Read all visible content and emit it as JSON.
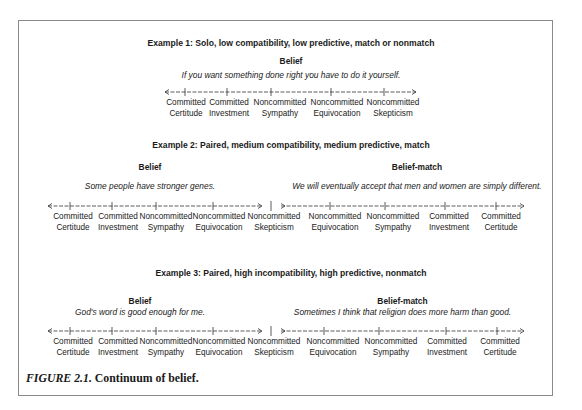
{
  "figure": {
    "caption_prefix": "FIGURE 2.1.",
    "caption_text": " Continuum of belief."
  },
  "examples": [
    {
      "title": "Example 1:  Solo, low compatibility, low predictive, match or nonmatch",
      "belief_label": "Belief",
      "belief_text": "If you want something done right you have to do it yourself.",
      "scale": [
        [
          "Committed",
          "Certitude"
        ],
        [
          "Committed",
          "Investment"
        ],
        [
          "Noncommitted",
          "Sympathy"
        ],
        [
          "Noncommitted",
          "Equivocation"
        ],
        [
          "Noncommitted",
          "Skepticism"
        ]
      ]
    },
    {
      "title": "Example 2:  Paired, medium compatibility, medium predictive, match",
      "belief_label": "Belief",
      "belief_text": "Some people have stronger genes.",
      "match_label": "Belief-match",
      "match_text": "We will eventually accept that men and women are simply different.",
      "scale_left": [
        [
          "Committed",
          "Certitude"
        ],
        [
          "Committed",
          "Investment"
        ],
        [
          "Noncommitted",
          "Sympathy"
        ],
        [
          "Noncommitted",
          "Equivocation"
        ],
        [
          "Noncommitted",
          "Skepticism"
        ]
      ],
      "scale_right": [
        [
          "Noncommitted",
          "Equivocation"
        ],
        [
          "Noncommitted",
          "Sympathy"
        ],
        [
          "Committed",
          "Investment"
        ],
        [
          "Committed",
          "Certitude"
        ]
      ]
    },
    {
      "title": "Example 3:  Paired, high incompatibility, high predictive, nonmatch",
      "belief_label": "Belief",
      "belief_text": "God's word is good enough for me.",
      "match_label": "Belief-match",
      "match_text": "Sometimes I think that religion does more harm than good.",
      "scale_left": [
        [
          "Committed",
          "Certitude"
        ],
        [
          "Committed",
          "Investment"
        ],
        [
          "Noncommitted",
          "Sympathy"
        ],
        [
          "Noncommitted",
          "Equivocation"
        ],
        [
          "Noncommitted",
          "Skepticism"
        ]
      ],
      "scale_right": [
        [
          "Noncommitted",
          "Equivocation"
        ],
        [
          "Noncommitted",
          "Sympathy"
        ],
        [
          "Committed",
          "Investment"
        ],
        [
          "Committed",
          "Certitude"
        ]
      ]
    }
  ]
}
